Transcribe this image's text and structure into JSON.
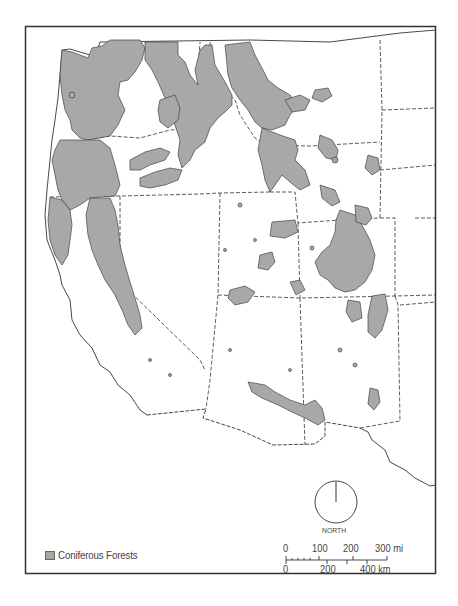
{
  "map": {
    "subject": "Western United States",
    "theme_colors": {
      "forest_fill": "#a8a8a8",
      "outline": "#333333",
      "background": "#ffffff"
    }
  },
  "legend": {
    "items": [
      {
        "label": "Coniferous Forests",
        "color": "#a8a8a8"
      }
    ]
  },
  "north_arrow": {
    "label": "NORTH"
  },
  "scale_bar": {
    "miles": {
      "ticks": [
        "0",
        "100",
        "200",
        "300 mi"
      ]
    },
    "kilometers": {
      "ticks": [
        "0",
        "200",
        "400 km"
      ]
    }
  }
}
